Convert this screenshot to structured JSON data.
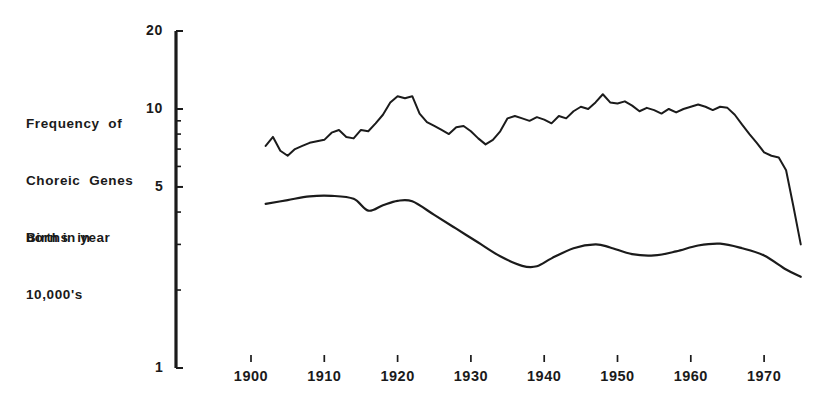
{
  "figure": {
    "background_color": "#ffffff",
    "ink_color": "#1b1b1b",
    "labels": {
      "frequency_line1": "Frequency  of",
      "frequency_line2": "Choreic  Genes",
      "frequency_line3": "born in year",
      "births_line1": "Births  in",
      "births_line2": "10,000's"
    }
  },
  "chart_data": {
    "type": "line",
    "title": "",
    "xlabel": "",
    "ylabel": "",
    "yscale": "log",
    "ylim": [
      1,
      20
    ],
    "xlim": [
      1902,
      1975
    ],
    "grid": false,
    "legend": "none",
    "y_tick_labels": [
      "20",
      "10",
      "5",
      "1"
    ],
    "y_tick_values": [
      20,
      10,
      5,
      1
    ],
    "y_minor_ticks": [
      9,
      8,
      7,
      6,
      4,
      3,
      2
    ],
    "x_tick_labels": [
      "1900",
      "1910",
      "1920",
      "1930",
      "1940",
      "1950",
      "1960",
      "1970"
    ],
    "x_tick_values": [
      1900,
      1910,
      1920,
      1930,
      1940,
      1950,
      1960,
      1970
    ],
    "series": [
      {
        "name": "Frequency of Choreic Genes born in year",
        "style": "jagged-annual",
        "x": [
          1902,
          1903,
          1904,
          1905,
          1906,
          1907,
          1908,
          1909,
          1910,
          1911,
          1912,
          1913,
          1914,
          1915,
          1916,
          1917,
          1918,
          1919,
          1920,
          1921,
          1922,
          1923,
          1924,
          1925,
          1926,
          1927,
          1928,
          1929,
          1930,
          1931,
          1932,
          1933,
          1934,
          1935,
          1936,
          1937,
          1938,
          1939,
          1940,
          1941,
          1942,
          1943,
          1944,
          1945,
          1946,
          1947,
          1948,
          1949,
          1950,
          1951,
          1952,
          1953,
          1954,
          1955,
          1956,
          1957,
          1958,
          1959,
          1960,
          1961,
          1962,
          1963,
          1964,
          1965,
          1966,
          1967,
          1968,
          1969,
          1970,
          1971,
          1972,
          1973,
          1974,
          1975
        ],
        "values": [
          7.2,
          7.8,
          6.9,
          6.6,
          7.0,
          7.2,
          7.4,
          7.5,
          7.6,
          8.1,
          8.3,
          7.8,
          7.7,
          8.3,
          8.2,
          8.8,
          9.5,
          10.6,
          11.2,
          11.0,
          11.2,
          9.6,
          8.9,
          8.6,
          8.3,
          8.0,
          8.5,
          8.6,
          8.2,
          7.7,
          7.3,
          7.6,
          8.2,
          9.2,
          9.4,
          9.2,
          9.0,
          9.3,
          9.1,
          8.8,
          9.4,
          9.2,
          9.8,
          10.2,
          10.0,
          10.6,
          11.4,
          10.6,
          10.5,
          10.7,
          10.3,
          9.8,
          10.1,
          9.9,
          9.6,
          10.0,
          9.7,
          10.0,
          10.2,
          10.4,
          10.2,
          9.9,
          10.2,
          10.1,
          9.5,
          8.7,
          8.0,
          7.4,
          6.8,
          6.6,
          6.5,
          5.8,
          4.2,
          3.0
        ]
      },
      {
        "name": "Births in 10,000's",
        "style": "smooth",
        "x": [
          1902,
          1905,
          1908,
          1911,
          1914,
          1916,
          1918,
          1920,
          1922,
          1925,
          1928,
          1931,
          1934,
          1937,
          1939,
          1941,
          1944,
          1947,
          1949,
          1952,
          1955,
          1958,
          1961,
          1964,
          1967,
          1970,
          1973,
          1975
        ],
        "values": [
          4.3,
          4.45,
          4.6,
          4.62,
          4.5,
          4.05,
          4.25,
          4.42,
          4.4,
          3.9,
          3.45,
          3.05,
          2.7,
          2.48,
          2.47,
          2.65,
          2.9,
          3.0,
          2.92,
          2.75,
          2.72,
          2.82,
          2.97,
          3.02,
          2.9,
          2.72,
          2.4,
          2.25
        ]
      }
    ]
  }
}
